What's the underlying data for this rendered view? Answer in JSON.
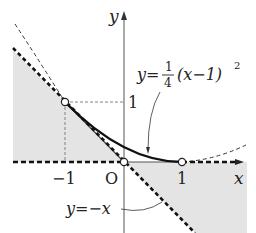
{
  "diagram": {
    "axes": {
      "x_label": "x",
      "y_label": "y",
      "origin_label": "O",
      "x_ticks": [
        {
          "value": -1,
          "label": "−1"
        },
        {
          "value": 1,
          "label": "1"
        }
      ],
      "y_ticks": [
        {
          "value": 1,
          "label": "1"
        }
      ]
    },
    "curves": [
      {
        "name": "parabola",
        "equation_prefix": "y=",
        "frac_num": "1",
        "frac_den": "4",
        "equation_suffix": "(x−1)",
        "exponent": "2"
      },
      {
        "name": "line",
        "equation": "y=−x"
      }
    ],
    "points": [
      {
        "x": -1,
        "y": 1,
        "style": "open"
      },
      {
        "x": 0,
        "y": 0,
        "style": "open"
      },
      {
        "x": 1,
        "y": 0,
        "style": "open"
      }
    ],
    "shading": {
      "color": "#e4e4e4",
      "description": "region between y=-x and x-axis"
    },
    "colors": {
      "ink": "#222222",
      "shade": "#e4e4e4"
    }
  }
}
